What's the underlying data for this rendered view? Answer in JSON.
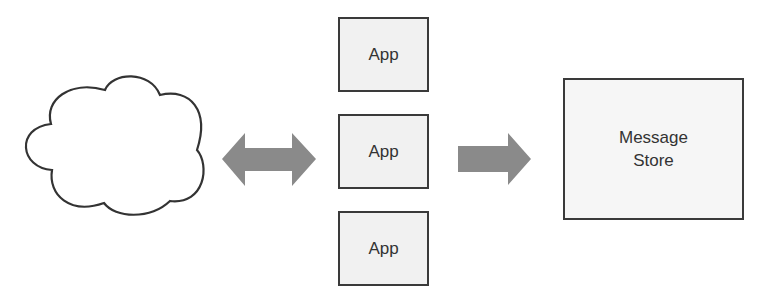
{
  "diagram": {
    "nodes": [
      {
        "id": "internet",
        "shape": "cloud",
        "label": ""
      },
      {
        "id": "app1",
        "shape": "rect",
        "label": "App"
      },
      {
        "id": "app2",
        "shape": "rect",
        "label": "App"
      },
      {
        "id": "app3",
        "shape": "rect",
        "label": "App"
      },
      {
        "id": "store",
        "shape": "rect",
        "label": "Message\nStore"
      }
    ],
    "edges": [
      {
        "from": "internet",
        "to": "app2",
        "style": "double-arrow"
      },
      {
        "from": "app2",
        "to": "store",
        "style": "arrow"
      }
    ],
    "colors": {
      "arrow": "#8a8a8a",
      "box_fill": "#f1f1f1",
      "border": "#3a3a3a",
      "text": "#333333"
    }
  }
}
